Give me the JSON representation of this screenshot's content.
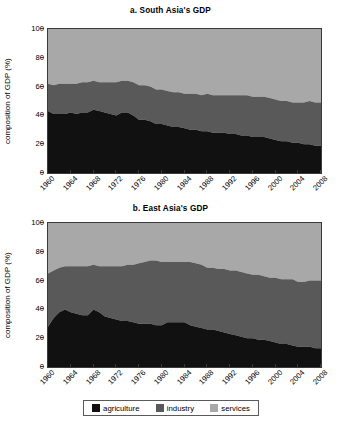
{
  "figure": {
    "legend": {
      "items": [
        {
          "label": "agriculture",
          "color": "#111111",
          "key": "agriculture"
        },
        {
          "label": "industry",
          "color": "#595959",
          "key": "industry"
        },
        {
          "label": "services",
          "color": "#a8a8a8",
          "key": "services"
        }
      ]
    }
  },
  "chart_data": [
    {
      "type": "area",
      "id": "south-asia",
      "title": "a. South Asia's GDP",
      "xlabel": "",
      "ylabel": "composition of GDP (%)",
      "ylim": [
        0,
        100
      ],
      "yticks": [
        0,
        20,
        40,
        60,
        80,
        100
      ],
      "xlim": [
        1960,
        2008
      ],
      "xticks": [
        1960,
        1964,
        1968,
        1972,
        1976,
        1980,
        1984,
        1988,
        1992,
        1996,
        2000,
        2004,
        2008
      ],
      "grid": false,
      "stacked": true,
      "legend_position": "bottom",
      "x": [
        1960,
        1961,
        1962,
        1963,
        1964,
        1965,
        1966,
        1967,
        1968,
        1969,
        1970,
        1971,
        1972,
        1973,
        1974,
        1975,
        1976,
        1977,
        1978,
        1979,
        1980,
        1981,
        1982,
        1983,
        1984,
        1985,
        1986,
        1987,
        1988,
        1989,
        1990,
        1991,
        1992,
        1993,
        1994,
        1995,
        1996,
        1997,
        1998,
        1999,
        2000,
        2001,
        2002,
        2003,
        2004,
        2005,
        2006,
        2007,
        2008
      ],
      "series": [
        {
          "name": "agriculture",
          "color": "#111111",
          "values": [
            43,
            41,
            41,
            41,
            42,
            41,
            42,
            42,
            44,
            43,
            42,
            41,
            40,
            42,
            42,
            40,
            37,
            37,
            36,
            34,
            34,
            33,
            32,
            32,
            31,
            30,
            30,
            29,
            29,
            28,
            28,
            28,
            27,
            27,
            26,
            26,
            25,
            25,
            25,
            24,
            23,
            22,
            22,
            21,
            21,
            20,
            20,
            19,
            19
          ]
        },
        {
          "name": "industry",
          "color": "#595959",
          "values": [
            19,
            20,
            21,
            21,
            20,
            21,
            21,
            21,
            20,
            20,
            21,
            22,
            23,
            22,
            22,
            23,
            24,
            24,
            24,
            24,
            24,
            24,
            24,
            24,
            24,
            25,
            25,
            25,
            26,
            26,
            26,
            26,
            27,
            27,
            28,
            28,
            28,
            28,
            28,
            28,
            28,
            28,
            28,
            28,
            28,
            29,
            30,
            30,
            30
          ]
        },
        {
          "name": "services",
          "color": "#a8a8a8",
          "values": [
            38,
            39,
            38,
            38,
            38,
            38,
            37,
            37,
            36,
            37,
            37,
            37,
            37,
            36,
            36,
            37,
            39,
            39,
            40,
            42,
            42,
            43,
            44,
            44,
            45,
            45,
            45,
            46,
            45,
            46,
            46,
            46,
            46,
            46,
            46,
            46,
            47,
            47,
            47,
            48,
            49,
            50,
            50,
            51,
            51,
            51,
            50,
            51,
            51
          ]
        }
      ]
    },
    {
      "type": "area",
      "id": "east-asia",
      "title": "b. East Asia's GDP",
      "xlabel": "",
      "ylabel": "composition of GDP (%)",
      "ylim": [
        0,
        100
      ],
      "yticks": [
        0,
        20,
        40,
        60,
        80,
        100
      ],
      "xlim": [
        1960,
        2008
      ],
      "xticks": [
        1960,
        1964,
        1968,
        1972,
        1976,
        1980,
        1984,
        1988,
        1992,
        1996,
        2000,
        2004,
        2008
      ],
      "grid": false,
      "stacked": true,
      "legend_position": "bottom",
      "x": [
        1960,
        1961,
        1962,
        1963,
        1964,
        1965,
        1966,
        1967,
        1968,
        1969,
        1970,
        1971,
        1972,
        1973,
        1974,
        1975,
        1976,
        1977,
        1978,
        1979,
        1980,
        1981,
        1982,
        1983,
        1984,
        1985,
        1986,
        1987,
        1988,
        1989,
        1990,
        1991,
        1992,
        1993,
        1994,
        1995,
        1996,
        1997,
        1998,
        1999,
        2000,
        2001,
        2002,
        2003,
        2004,
        2005,
        2006,
        2007,
        2008
      ],
      "series": [
        {
          "name": "agriculture",
          "color": "#111111",
          "values": [
            28,
            34,
            38,
            40,
            38,
            37,
            36,
            36,
            40,
            38,
            35,
            34,
            33,
            32,
            32,
            31,
            30,
            30,
            30,
            29,
            29,
            31,
            31,
            31,
            31,
            29,
            28,
            27,
            26,
            26,
            25,
            24,
            23,
            22,
            21,
            20,
            20,
            19,
            19,
            18,
            17,
            16,
            16,
            15,
            14,
            14,
            14,
            13,
            13
          ]
        },
        {
          "name": "industry",
          "color": "#595959",
          "values": [
            37,
            33,
            31,
            30,
            32,
            33,
            34,
            34,
            31,
            32,
            35,
            36,
            37,
            38,
            39,
            40,
            42,
            43,
            44,
            45,
            44,
            42,
            42,
            42,
            42,
            44,
            44,
            44,
            43,
            43,
            43,
            44,
            44,
            45,
            45,
            45,
            44,
            45,
            44,
            44,
            45,
            45,
            45,
            46,
            45,
            45,
            46,
            47,
            47
          ]
        },
        {
          "name": "services",
          "color": "#a8a8a8",
          "values": [
            35,
            33,
            31,
            30,
            30,
            30,
            30,
            30,
            29,
            30,
            30,
            30,
            30,
            30,
            29,
            29,
            28,
            27,
            26,
            26,
            27,
            27,
            27,
            27,
            27,
            27,
            28,
            29,
            31,
            31,
            32,
            32,
            33,
            33,
            34,
            35,
            36,
            36,
            37,
            38,
            38,
            39,
            39,
            39,
            41,
            41,
            40,
            40,
            40
          ]
        }
      ]
    }
  ]
}
